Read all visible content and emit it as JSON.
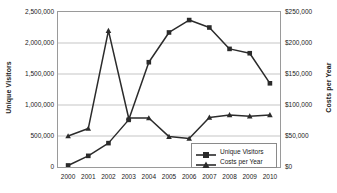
{
  "chart_data": {
    "type": "line",
    "title": "",
    "xlabel": "",
    "grid": true,
    "legend_position": "bottom-right",
    "categories": [
      "2000",
      "2001",
      "2002",
      "2003",
      "2004",
      "2005",
      "2006",
      "2007",
      "2008",
      "2009",
      "2010"
    ],
    "axes": {
      "left": {
        "label": "Unique Visitors",
        "ylim": [
          0,
          2500000
        ],
        "ticks": [
          0,
          500000,
          1000000,
          1500000,
          2000000,
          2500000
        ],
        "tick_labels": [
          "0",
          "500,000",
          "1,000,000",
          "1,500,000",
          "2,000,000",
          "2,500,000"
        ]
      },
      "right": {
        "label": "Costs per Year",
        "ylim": [
          0,
          250000
        ],
        "ticks": [
          0,
          50000,
          100000,
          150000,
          200000,
          250000
        ],
        "tick_labels": [
          "$0",
          "$50,000",
          "$100,000",
          "$150,000",
          "$200,000",
          "$250,000"
        ]
      }
    },
    "series": [
      {
        "name": "Unique Visitors",
        "axis": "left",
        "marker": "square",
        "color": "#2b2b2b",
        "values": [
          25000,
          180000,
          385000,
          760000,
          1690000,
          2170000,
          2370000,
          2250000,
          1905000,
          1835000,
          1350000
        ]
      },
      {
        "name": "Costs per Year",
        "axis": "right",
        "marker": "triangle",
        "color": "#2b2b2b",
        "values": [
          50000,
          62000,
          220000,
          79000,
          79000,
          49000,
          46000,
          80000,
          84000,
          82000,
          84000
        ]
      }
    ]
  },
  "legend": {
    "items": [
      {
        "label": "Unique Visitors"
      },
      {
        "label": "Costs per Year"
      }
    ]
  }
}
